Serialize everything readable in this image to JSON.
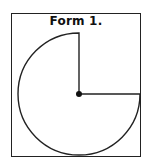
{
  "figure": {
    "title": "Form 1.",
    "shape": "three-quarter-circle-sector",
    "missing_quadrant": "upper-right",
    "colors": {
      "stroke": "#222222",
      "background": "#ffffff",
      "center_dot": "#111111"
    }
  }
}
